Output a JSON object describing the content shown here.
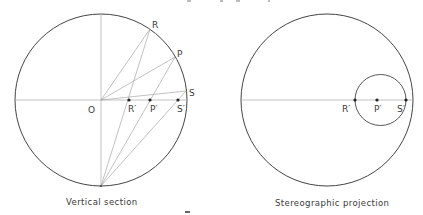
{
  "figures": {
    "left": {
      "caption": "Vertical section",
      "labels": {
        "O": "O",
        "R": "R",
        "P": "P",
        "S": "S",
        "R_prime": "R′",
        "P_prime": "P′",
        "S_prime": "S′"
      }
    },
    "right": {
      "caption": "Stereographic projection",
      "labels": {
        "R_prime": "R′",
        "P_prime": "P′",
        "S_prime": "S′"
      }
    }
  },
  "colors": {
    "circle": "#444444",
    "construction": "#9a9a9a",
    "point": "#222222"
  }
}
